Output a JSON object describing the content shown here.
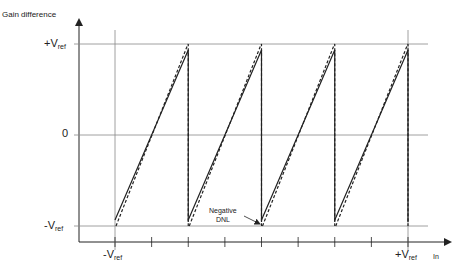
{
  "diagram": {
    "y_axis_label": "Gain difference",
    "x_axis_label": "In",
    "y_levels": [
      {
        "id": "plus-vref",
        "main": "+V",
        "sub": "ref",
        "value": 1
      },
      {
        "id": "zero",
        "main": "0",
        "sub": "",
        "value": 0
      },
      {
        "id": "minus-vref",
        "main": "-V",
        "sub": "ref",
        "value": -1
      }
    ],
    "x_labels": [
      {
        "id": "minus-vref",
        "main": "-V",
        "sub": "ref",
        "value": -1
      },
      {
        "id": "plus-vref",
        "main": "+V",
        "sub": "ref",
        "value": 1
      }
    ],
    "x_ticks": 9,
    "sawtooth_segments": 4,
    "annotation": {
      "line1": "Negative",
      "line2": "DNL"
    },
    "colors": {
      "line": "#222222",
      "grid": "#888888"
    }
  }
}
